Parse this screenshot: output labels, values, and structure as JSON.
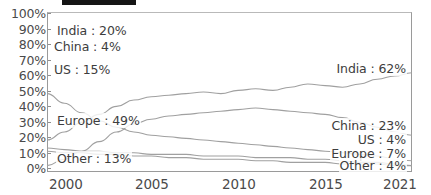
{
  "top_bar": {
    "present": true,
    "color": "#151515"
  },
  "chart_data": {
    "type": "line",
    "title": "",
    "subtitle": "",
    "xlabel": "",
    "ylabel": "",
    "xlim": [
      2000,
      2021
    ],
    "ylim": [
      0,
      100
    ],
    "grid": false,
    "legend": "inline-endpoint-labels",
    "x_tick_labels": [
      "2000",
      "2005",
      "2010",
      "2015",
      "2021"
    ],
    "x_ticks": [
      2000,
      2005,
      2010,
      2015,
      2021
    ],
    "y_tick_labels": [
      "0%",
      "10%",
      "20%",
      "30%",
      "40%",
      "50%",
      "60%",
      "70%",
      "80%",
      "90%",
      "100%"
    ],
    "y_ticks": [
      0,
      10,
      20,
      30,
      40,
      50,
      60,
      70,
      80,
      90,
      100
    ],
    "x": [
      2000,
      2001,
      2002,
      2003,
      2004,
      2005,
      2006,
      2007,
      2008,
      2009,
      2010,
      2011,
      2012,
      2013,
      2014,
      2015,
      2016,
      2017,
      2018,
      2019,
      2020,
      2021
    ],
    "series": [
      {
        "name": "India",
        "start_label": "India : 20%",
        "end_label": "India : 62%",
        "start_value": 20,
        "end_value": 62,
        "values": [
          20,
          25,
          31,
          36,
          41,
          45,
          47,
          48,
          49,
          50,
          49,
          51,
          52,
          51,
          53,
          55,
          54,
          53,
          55,
          58,
          60,
          62
        ]
      },
      {
        "name": "China",
        "start_label": "China : 4%",
        "end_label": "China : 23%",
        "start_value": 4,
        "end_value": 23,
        "values": [
          4,
          8,
          13,
          19,
          25,
          30,
          33,
          35,
          36,
          37,
          38,
          39,
          40,
          39,
          38,
          37,
          36,
          34,
          31,
          28,
          25,
          23
        ]
      },
      {
        "name": "US",
        "start_label": "US : 15%",
        "end_label": "US : 4%",
        "start_value": 15,
        "end_value": 4,
        "values": [
          15,
          14,
          13,
          13,
          12,
          12,
          11,
          11,
          11,
          10,
          10,
          10,
          9,
          9,
          9,
          8,
          8,
          7,
          6,
          6,
          5,
          4
        ]
      },
      {
        "name": "Europe",
        "start_label": "Europe : 49%",
        "end_label": "Europe : 7%",
        "start_value": 49,
        "end_value": 7,
        "values": [
          49,
          43,
          37,
          32,
          28,
          25,
          23,
          22,
          21,
          20,
          19,
          18,
          17,
          16,
          15,
          14,
          13,
          12,
          11,
          10,
          8,
          7
        ]
      },
      {
        "name": "Other",
        "start_label": "Other : 13%",
        "end_label": "Other : 4%",
        "start_value": 13,
        "end_value": 4,
        "values": [
          13,
          12,
          12,
          11,
          11,
          10,
          10,
          9,
          9,
          8,
          8,
          8,
          7,
          7,
          6,
          6,
          6,
          5,
          5,
          5,
          4,
          4
        ]
      }
    ],
    "colors": {
      "line": "#a0a0a0",
      "axis": "#9a9a9a",
      "tick_text": "#4a4a4a",
      "label_text": "#3d3d3d"
    }
  },
  "labels_left": [
    {
      "text": "India : 20%",
      "name": "label-left-india"
    },
    {
      "text": "China : 4%",
      "name": "label-left-china"
    },
    {
      "text": "US : 15%",
      "name": "label-left-us"
    },
    {
      "text": "Europe : 49%",
      "name": "label-left-europe"
    },
    {
      "text": "Other : 13%",
      "name": "label-left-other"
    }
  ],
  "labels_right": [
    {
      "text": "India : 62%",
      "name": "label-right-india"
    },
    {
      "text": "China : 23%",
      "name": "label-right-china"
    },
    {
      "text": "US : 4%",
      "name": "label-right-us"
    },
    {
      "text": "Europe : 7%",
      "name": "label-right-europe"
    },
    {
      "text": "Other : 4%",
      "name": "label-right-other"
    }
  ]
}
